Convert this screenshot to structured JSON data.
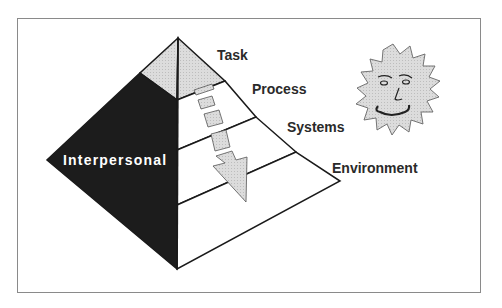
{
  "diagram": {
    "type": "pyramid",
    "layers": [
      {
        "label": "Task"
      },
      {
        "label": "Process"
      },
      {
        "label": "Systems"
      },
      {
        "label": "Environment"
      }
    ],
    "side_face_label": "Interpersonal",
    "flow_indicator": "downward-arrow",
    "decoration": "smiling-sun-face"
  },
  "colors": {
    "interpersonal_face": "#1c1c1c",
    "task_cap": "#d4d4d4",
    "arrow_fill": "#d6d6d6",
    "outline": "#1a1a1a",
    "frame": "#8a8a8a",
    "text": "#2a2a2a"
  }
}
